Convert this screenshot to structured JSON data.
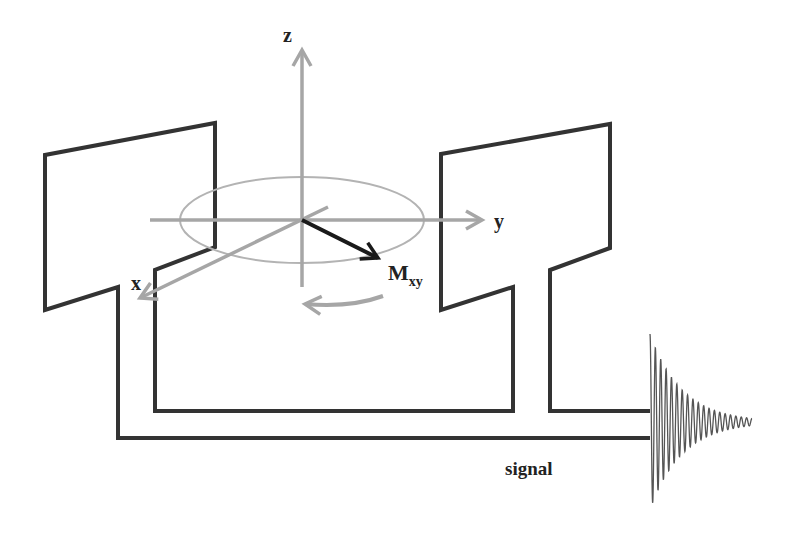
{
  "labels": {
    "z_axis": "z",
    "y_axis": "y",
    "x_axis": "x",
    "magnetization": "M",
    "magnetization_sub": "xy",
    "signal": "signal"
  },
  "colors": {
    "coil": "#333333",
    "axes": "#a6a6a6",
    "vector": "#1a1a1a",
    "fid": "#555555"
  },
  "fid": {
    "x_start": 650,
    "x_end": 752,
    "center_y": 422,
    "amplitude": 88,
    "cycles": 19
  }
}
